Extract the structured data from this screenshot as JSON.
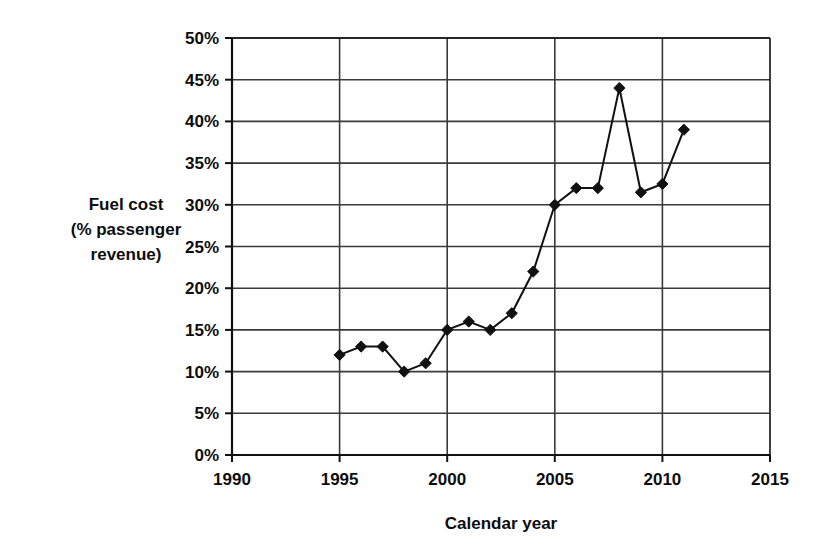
{
  "chart_data": {
    "type": "line",
    "title": "",
    "xlabel": "Calendar year",
    "ylabel": "Fuel cost\n(% passenger revenue)",
    "ylabel_lines": [
      "Fuel cost",
      "(% passenger",
      "revenue)"
    ],
    "x": [
      1995,
      1996,
      1997,
      1998,
      1999,
      2000,
      2001,
      2002,
      2003,
      2004,
      2005,
      2006,
      2007,
      2008,
      2009,
      2010,
      2011
    ],
    "values": [
      12,
      13,
      13,
      10,
      11,
      15,
      16,
      15,
      17,
      22,
      30,
      32,
      32,
      44,
      31.5,
      32.5,
      39
    ],
    "series": [
      {
        "name": "Fuel cost (% passenger revenue)",
        "values": [
          12,
          13,
          13,
          10,
          11,
          15,
          16,
          15,
          17,
          22,
          30,
          32,
          32,
          44,
          31.5,
          32.5,
          39
        ]
      }
    ],
    "xlim": [
      1990,
      2015
    ],
    "ylim": [
      0,
      50
    ],
    "xticks": [
      1990,
      1995,
      2000,
      2005,
      2010,
      2015
    ],
    "xtick_labels": [
      "1990",
      "1995",
      "2000",
      "2005",
      "2010",
      "2015"
    ],
    "yticks": [
      0,
      5,
      10,
      15,
      20,
      25,
      30,
      35,
      40,
      45,
      50
    ],
    "ytick_labels": [
      "0%",
      "5%",
      "10%",
      "15%",
      "20%",
      "25%",
      "30%",
      "35%",
      "40%",
      "45%",
      "50%"
    ],
    "grid": true,
    "grid_axes": "both",
    "legend": false,
    "legend_position": "none",
    "marker": "diamond",
    "line_color": "#111111",
    "marker_color": "#111111",
    "grid_color": "#3a3a3a",
    "axis_color": "#111111",
    "background_color": "#ffffff"
  }
}
